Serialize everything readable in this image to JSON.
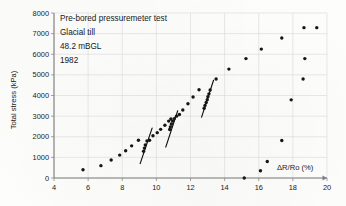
{
  "chart_data": {
    "type": "scatter",
    "title": "",
    "xlabel": "ΔR/Ro (%)",
    "ylabel": "Total stress (kPa)",
    "xlim": [
      4,
      20
    ],
    "ylim": [
      0,
      8000
    ],
    "xticks": [
      4,
      6,
      8,
      10,
      12,
      14,
      16,
      18,
      20
    ],
    "yticks": [
      0,
      1000,
      2000,
      3000,
      4000,
      5000,
      6000,
      7000,
      8000
    ],
    "grid": true,
    "legend": "none",
    "annotations": [
      "Pre-bored pressuremeter test",
      "Glacial till",
      "48.2 mBGL",
      "1982"
    ],
    "series": [
      {
        "name": "Loading branch",
        "points": [
          [
            5.7,
            400
          ],
          [
            6.75,
            600
          ],
          [
            7.35,
            870
          ],
          [
            7.85,
            1110
          ],
          [
            8.2,
            1320
          ],
          [
            8.55,
            1560
          ],
          [
            8.95,
            1830
          ],
          [
            9.25,
            1300
          ],
          [
            9.3,
            1450
          ],
          [
            9.35,
            1600
          ],
          [
            9.45,
            1800
          ],
          [
            9.6,
            1830
          ],
          [
            9.8,
            2050
          ],
          [
            10.05,
            2200
          ],
          [
            10.25,
            2360
          ],
          [
            10.5,
            2560
          ],
          [
            10.72,
            2760
          ],
          [
            10.85,
            2860
          ],
          [
            10.78,
            2350
          ],
          [
            10.82,
            2480
          ],
          [
            10.88,
            2620
          ],
          [
            10.95,
            2760
          ],
          [
            11.05,
            2880
          ],
          [
            11.18,
            3000
          ],
          [
            11.35,
            3080
          ],
          [
            11.55,
            3300
          ],
          [
            11.85,
            3600
          ],
          [
            12.15,
            3930
          ],
          [
            12.5,
            4280
          ],
          [
            12.8,
            3380
          ],
          [
            12.85,
            3520
          ],
          [
            12.92,
            3660
          ],
          [
            12.98,
            3800
          ],
          [
            13.02,
            3940
          ],
          [
            13.08,
            4080
          ],
          [
            13.15,
            4270
          ],
          [
            13.5,
            4800
          ],
          [
            14.25,
            5280
          ],
          [
            15.25,
            5790
          ],
          [
            16.15,
            6250
          ],
          [
            17.35,
            6790
          ],
          [
            18.65,
            7290
          ],
          [
            19.4,
            7290
          ]
        ]
      },
      {
        "name": "Unloading branch",
        "points": [
          [
            18.7,
            5790
          ],
          [
            18.6,
            4800
          ],
          [
            17.9,
            3790
          ],
          [
            17.35,
            1820
          ],
          [
            16.5,
            800
          ],
          [
            16.1,
            350
          ],
          [
            15.15,
            0
          ]
        ]
      }
    ],
    "tangent_lines": [
      {
        "name": "unload-reload-modulus-1",
        "x1": 9.05,
        "y1": 700,
        "x2": 9.75,
        "y2": 2420
      },
      {
        "name": "unload-reload-modulus-2",
        "x1": 10.55,
        "y1": 1500,
        "x2": 11.25,
        "y2": 3260
      },
      {
        "name": "unload-reload-modulus-3",
        "x1": 12.65,
        "y1": 2950,
        "x2": 13.35,
        "y2": 4740
      }
    ]
  },
  "axes": {
    "y_title": "Total stress (kPa)",
    "x_title": "ΔR/Ro (%)",
    "y_tick_labels": [
      "0",
      "1000",
      "2000",
      "3000",
      "4000",
      "5000",
      "6000",
      "7000",
      "8000"
    ],
    "x_tick_labels": [
      "4",
      "6",
      "8",
      "10",
      "12",
      "14",
      "16",
      "18",
      "20"
    ]
  },
  "annotation_block": {
    "line1": "Pre-bored pressuremeter test",
    "line2": "Glacial till",
    "line3": "48.2 mBGL",
    "line4": "1982"
  },
  "colors": {
    "point": "#151515",
    "grid": "#d8d8d8",
    "axis": "#7f7f7f",
    "text": "#1a1a1a",
    "background": "#fdfdfc"
  }
}
